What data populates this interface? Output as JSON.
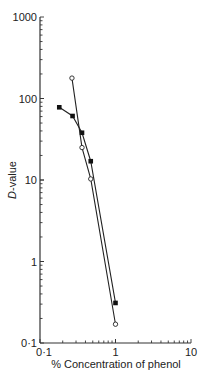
{
  "chart_data": {
    "type": "line",
    "title": "",
    "xlabel": "% Concentration of phenol",
    "ylabel": "D-value",
    "xscale": "log",
    "yscale": "log",
    "xlim": [
      0.1,
      10
    ],
    "ylim": [
      0.1,
      1000
    ],
    "x_tick_labels": [
      "0·1",
      "1",
      "10"
    ],
    "x_ticks": [
      0.1,
      1,
      10
    ],
    "y_tick_labels": [
      "0·1",
      "1",
      "10",
      "100",
      "1000"
    ],
    "y_ticks": [
      0.1,
      1,
      10,
      100,
      1000
    ],
    "grid": false,
    "legend": null,
    "series": [
      {
        "name": "filled squares",
        "marker": "filled-square",
        "x": [
          0.18,
          0.27,
          0.36,
          0.47,
          1.0
        ],
        "y": [
          78,
          61,
          38,
          17,
          0.31
        ]
      },
      {
        "name": "open circles",
        "marker": "open-circle",
        "x": [
          0.265,
          0.36,
          0.47,
          1.0
        ],
        "y": [
          178,
          25,
          10.3,
          0.17
        ]
      }
    ]
  }
}
